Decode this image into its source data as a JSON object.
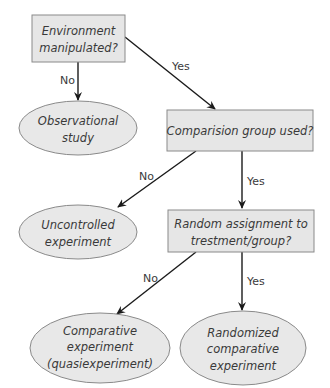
{
  "diagram": {
    "type": "flowchart",
    "colors": {
      "box_fill": "#e6e6e6",
      "ellipse_fill": "#e8e8e8",
      "border": "#8a8a8a",
      "arrow": "#1a1a1a",
      "text": "#3a3a3a"
    },
    "nodes": {
      "env": {
        "shape": "rect",
        "lines": [
          "Environment",
          "manipulated?"
        ]
      },
      "obs": {
        "shape": "ellipse",
        "lines": [
          "Observational",
          "study"
        ]
      },
      "comp": {
        "shape": "rect",
        "lines": [
          "Comparision group used?"
        ]
      },
      "unc": {
        "shape": "ellipse",
        "lines": [
          "Uncontrolled",
          "experiment"
        ]
      },
      "rand": {
        "shape": "rect",
        "lines": [
          "Random assignment to",
          "trestment/group?"
        ]
      },
      "quasi": {
        "shape": "ellipse",
        "lines": [
          "Comparative",
          "experiment",
          "(quasiexperiment)"
        ]
      },
      "rce": {
        "shape": "ellipse",
        "lines": [
          "Randomized",
          "comparative",
          "experiment"
        ]
      }
    },
    "edges": [
      {
        "from": "env",
        "to": "obs",
        "label": "No"
      },
      {
        "from": "env",
        "to": "comp",
        "label": "Yes"
      },
      {
        "from": "comp",
        "to": "unc",
        "label": "No"
      },
      {
        "from": "comp",
        "to": "rand",
        "label": "Yes"
      },
      {
        "from": "rand",
        "to": "quasi",
        "label": "No"
      },
      {
        "from": "rand",
        "to": "rce",
        "label": "Yes"
      }
    ]
  }
}
